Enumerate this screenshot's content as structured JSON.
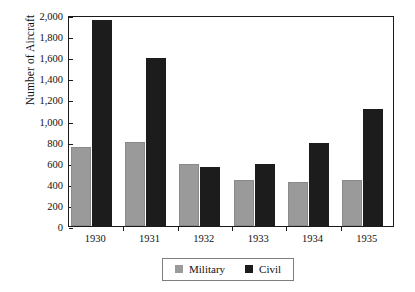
{
  "chart_data": {
    "type": "bar",
    "title": "",
    "xlabel": "",
    "ylabel": "Number of Aircraft",
    "categories": [
      "1930",
      "1931",
      "1932",
      "1933",
      "1934",
      "1935"
    ],
    "series": [
      {
        "name": "Military",
        "color": "#9a9a9a",
        "values": [
          750,
          800,
          590,
          440,
          420,
          435
        ]
      },
      {
        "name": "Civil",
        "color": "#1c1c1c",
        "values": [
          1950,
          1590,
          560,
          590,
          790,
          1105
        ]
      }
    ],
    "ylim": [
      0,
      2000
    ],
    "ytick_values": [
      0,
      200,
      400,
      600,
      800,
      1000,
      1200,
      1400,
      1600,
      1800,
      2000
    ],
    "ytick_labels": [
      "0",
      "200",
      "400",
      "600",
      "800",
      "1,000",
      "1,200",
      "1,400",
      "1,600",
      "1,800",
      "2,000"
    ],
    "grid": false,
    "legend_position": "bottom-center",
    "frame": true
  },
  "legend": {
    "items": [
      {
        "label": "Military",
        "swatch": "military-swatch"
      },
      {
        "label": "Civil",
        "swatch": "civil-swatch"
      }
    ]
  }
}
